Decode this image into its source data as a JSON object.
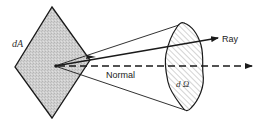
{
  "diagram": {
    "type": "solid-angle-radiance",
    "labels": {
      "area": "dA",
      "solid_angle": "d Ω",
      "ray": "Ray",
      "normal": "Normal"
    },
    "colors": {
      "area_fill": "#c8c8c8",
      "stroke": "#1a1a1a",
      "hatch": "#9a9a9a"
    }
  }
}
